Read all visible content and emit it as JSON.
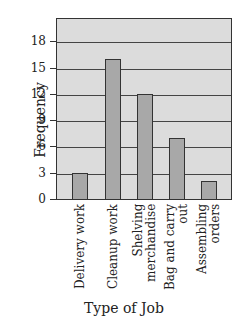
{
  "chart_data": {
    "type": "bar",
    "title": "",
    "xlabel": "Type of Job",
    "ylabel": "Frequency",
    "categories": [
      "Delivery work",
      "Cleanup work",
      "Shelving merchandise",
      "Bag and carry out",
      "Assembling orders"
    ],
    "category_lines": [
      [
        "Delivery work"
      ],
      [
        "Cleanup work"
      ],
      [
        "Shelving",
        "merchandise"
      ],
      [
        "Bag and carry",
        "out"
      ],
      [
        "Assembling",
        "orders"
      ]
    ],
    "values": [
      3,
      16,
      12,
      7,
      2
    ],
    "yticks": [
      0,
      3,
      6,
      9,
      12,
      15,
      18
    ],
    "ylim": [
      0,
      20.7
    ],
    "grid": true,
    "colors": {
      "plot_bg": "#dcdcdc",
      "bar": "#a8a8a8",
      "edge": "#333333"
    }
  }
}
